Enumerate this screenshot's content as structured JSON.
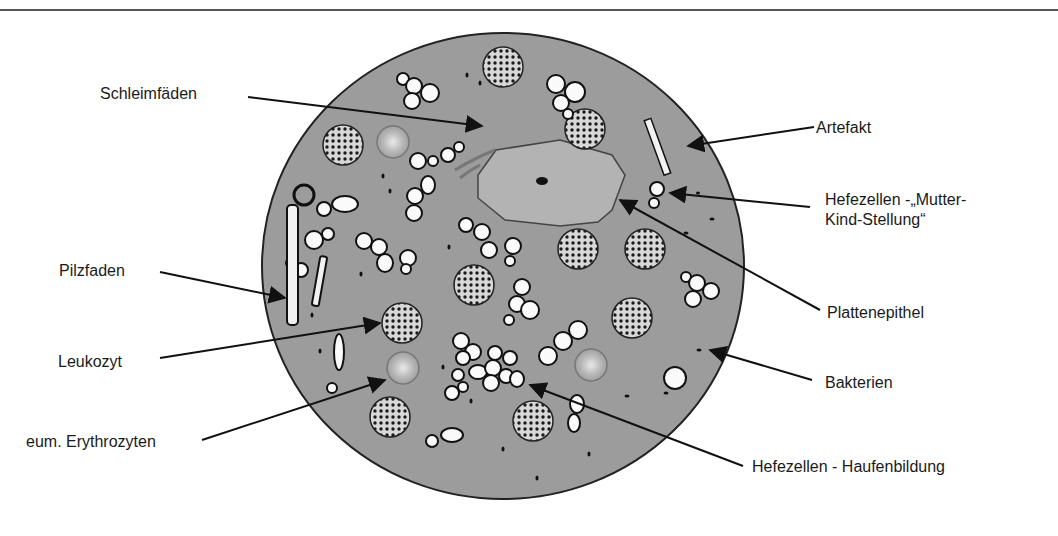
{
  "figure": {
    "type": "microscopy-schematic",
    "background_color": "#9a9a9a",
    "labels": [
      {
        "id": "schleimfaeden",
        "text": "Schleimfäden"
      },
      {
        "id": "artefakt",
        "text": "Artefakt"
      },
      {
        "id": "hefe-mutter-kind",
        "text_line1": "Hefezellen -„Mutter-",
        "text_line2": "Kind-Stellung“"
      },
      {
        "id": "pilzfaden",
        "text": "Pilzfaden"
      },
      {
        "id": "plattenepithel",
        "text": "Plattenepithel"
      },
      {
        "id": "leukozyt",
        "text": "Leukozyt"
      },
      {
        "id": "bakterien",
        "text": "Bakterien"
      },
      {
        "id": "erythrozyten",
        "text": "eum. Erythrozyten"
      },
      {
        "id": "hefe-haufen",
        "text": "Hefezellen - Haufenbildung"
      }
    ]
  }
}
